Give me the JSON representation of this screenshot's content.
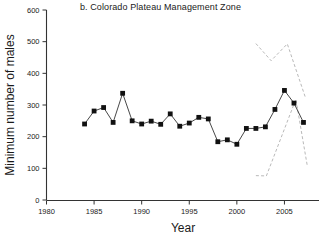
{
  "chart_data": {
    "type": "line",
    "title": "b. Colorado Plateau Management Zone",
    "xlabel": "Year",
    "ylabel": "Minimum number of males",
    "xlim": [
      1980,
      2008
    ],
    "ylim": [
      0,
      600
    ],
    "xticks": [
      1980,
      1985,
      1990,
      1995,
      2000,
      2005
    ],
    "yticks": [
      0,
      100,
      200,
      300,
      400,
      500,
      600
    ],
    "grid": false,
    "legend": "none",
    "marker": "filled-square",
    "series": [
      {
        "name": "Minimum number of males",
        "style": "solid-line-with-square-markers",
        "x": [
          1984,
          1985,
          1986,
          1987,
          1988,
          1989,
          1990,
          1991,
          1992,
          1993,
          1994,
          1995,
          1996,
          1997,
          1998,
          1999,
          2000,
          2001,
          2002,
          2003,
          2004,
          2005,
          2006,
          2007
        ],
        "values": [
          240,
          281,
          292,
          245,
          337,
          250,
          240,
          249,
          239,
          272,
          233,
          243,
          261,
          256,
          184,
          190,
          176,
          226,
          226,
          231,
          286,
          346,
          306,
          245
        ]
      },
      {
        "name": "upper confidence bound",
        "style": "dashed",
        "x": [
          2002,
          2003.6,
          2005.3,
          2007.2
        ],
        "values": [
          494,
          440,
          493,
          324
        ]
      },
      {
        "name": "lower confidence bound",
        "style": "dashed",
        "x": [
          2002,
          2003.1,
          2006.2,
          2007.4
        ],
        "values": [
          77,
          76,
          318,
          108
        ]
      }
    ]
  },
  "colors": {
    "axis": "#333333",
    "marker": "#111111",
    "line": "#333333",
    "dashed": "#b9b9b9",
    "text": "#1a1a1a",
    "background": "#ffffff"
  },
  "ticklabels": {
    "x": [
      "1980",
      "1985",
      "1990",
      "1995",
      "2000",
      "2005"
    ],
    "y": [
      "0",
      "100",
      "200",
      "300",
      "400",
      "500",
      "600"
    ]
  }
}
